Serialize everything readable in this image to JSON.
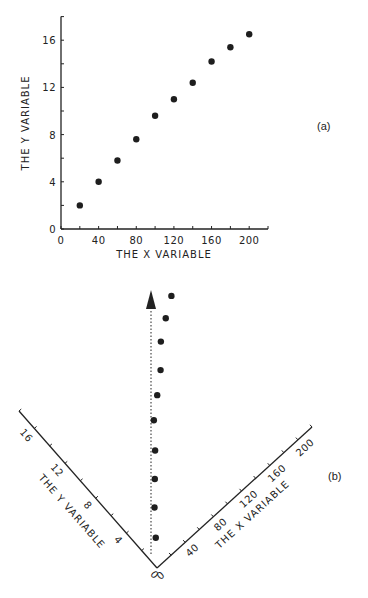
{
  "chart_data": [
    {
      "panel": "(a)",
      "type": "scatter",
      "title": "",
      "xlabel": "THE X VARIABLE",
      "ylabel": "THE Y VARIABLE",
      "xlim": [
        0,
        220
      ],
      "ylim": [
        0,
        18
      ],
      "xticks": [
        0,
        40,
        80,
        120,
        160,
        200
      ],
      "yticks": [
        0,
        4,
        8,
        12,
        16
      ],
      "minor_xticks": [
        20,
        60,
        100,
        140,
        180,
        220
      ],
      "minor_yticks": [
        2,
        6,
        10,
        14,
        18
      ],
      "grid": false,
      "legend": null,
      "points": [
        {
          "x": 20,
          "y": 2.0
        },
        {
          "x": 40,
          "y": 4.0
        },
        {
          "x": 60,
          "y": 5.8
        },
        {
          "x": 80,
          "y": 7.6
        },
        {
          "x": 100,
          "y": 9.6
        },
        {
          "x": 120,
          "y": 11.0
        },
        {
          "x": 140,
          "y": 12.4
        },
        {
          "x": 160,
          "y": 14.2
        },
        {
          "x": 180,
          "y": 15.4
        },
        {
          "x": 200,
          "y": 16.5
        }
      ]
    },
    {
      "panel": "(b)",
      "type": "scatter",
      "title": "",
      "xlabel": "THE X VARIABLE",
      "ylabel": "THE Y VARIABLE",
      "description": "Same data with axes rotated so that the direction of the main trend (dashed arrow) points vertically upward",
      "xlim": [
        0,
        220
      ],
      "ylim": [
        0,
        18
      ],
      "xticks": [
        0,
        40,
        80,
        120,
        160,
        200
      ],
      "yticks": [
        0,
        4,
        8,
        12,
        16
      ],
      "grid": false,
      "legend": null,
      "annotations": [
        "dashed arrow along trend direction"
      ],
      "points": [
        {
          "x": 20,
          "y": 2.0
        },
        {
          "x": 40,
          "y": 4.0
        },
        {
          "x": 60,
          "y": 5.8
        },
        {
          "x": 80,
          "y": 7.6
        },
        {
          "x": 100,
          "y": 9.6
        },
        {
          "x": 120,
          "y": 11.0
        },
        {
          "x": 140,
          "y": 12.4
        },
        {
          "x": 160,
          "y": 14.2
        },
        {
          "x": 180,
          "y": 15.4
        },
        {
          "x": 200,
          "y": 16.5
        }
      ]
    }
  ],
  "labels": {
    "panel_a": "(a)",
    "panel_b": "(b)",
    "x_title": "THE X VARIABLE",
    "y_title": "THE Y VARIABLE"
  },
  "style": {
    "ink": "#222222",
    "dot": "#1e1e1e",
    "background": "#ffffff"
  }
}
